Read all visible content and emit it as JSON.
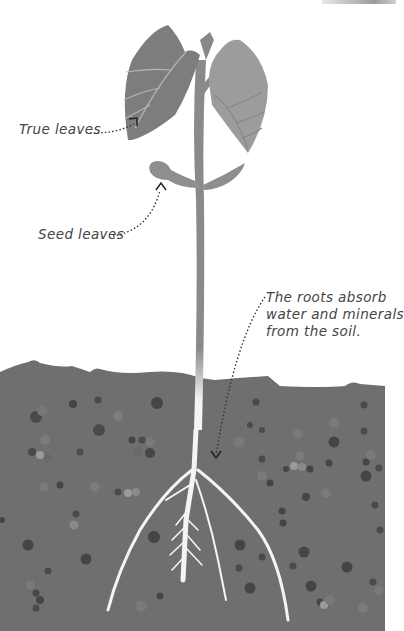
{
  "diagram": {
    "labels": {
      "true_leaves": "True leaves",
      "seed_leaves": "Seed leaves",
      "roots_line1": "The roots absorb",
      "roots_line2": "water and minerals",
      "roots_line3": "from the soil."
    },
    "colors": {
      "background": "#ffffff",
      "soil": "#6f6f6f",
      "leaf_dark": "#7d7d7d",
      "leaf_light": "#9c9c9c",
      "stem": "#8a8a8a",
      "root": "#f4f4f4",
      "text": "#444444",
      "pointer": "#333333"
    }
  }
}
